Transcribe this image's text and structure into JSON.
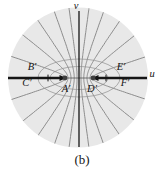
{
  "figure": {
    "caption": "(b)",
    "axis_labels": {
      "horizontal": "u",
      "vertical": "v"
    },
    "point_labels": [
      {
        "id": "B",
        "text": "B′"
      },
      {
        "id": "C",
        "text": "C′"
      },
      {
        "id": "A",
        "text": "A′"
      },
      {
        "id": "D",
        "text": "D′"
      },
      {
        "id": "E",
        "text": "E′"
      },
      {
        "id": "F",
        "text": "F′"
      }
    ],
    "colors": {
      "background": "#ffffff",
      "disk": "#e8e8e8",
      "curve": "#8c8c8c",
      "ellipse": "#a3a3a3",
      "axis": "#151515",
      "thin_axis": "#555555",
      "focus_dot": "#3f3f3f"
    },
    "geometry": {
      "width": 159,
      "height": 169,
      "disk_center": {
        "x": 78,
        "y": 77.5
      },
      "disk_radius": 70,
      "axis_y": 78,
      "vaxis_x": 79,
      "vaxis_top": 11,
      "vaxis_bottom": 147,
      "uaxis_left": 8,
      "uaxis_right": 147,
      "foci": [
        {
          "x": 65,
          "y": 78
        },
        {
          "x": 93,
          "y": 78
        }
      ],
      "tick_xs": [
        48,
        106
      ],
      "tick_half_height": 3.4,
      "ellipses": [
        {
          "rx": 29,
          "ry": 11.5
        },
        {
          "rx": 41,
          "ry": 19
        }
      ],
      "hyperbola_angles_deg": [
        18,
        38,
        55,
        70,
        82
      ],
      "focus_dot_radius": 2.4,
      "arrow_len": 7,
      "arrow_half_w": 2.9,
      "thick_axis_width": 2.6,
      "thin_axis_width": 0.8,
      "vaxis_width": 1.3,
      "curve_width": 1,
      "ellipse_width": 0.9
    }
  }
}
